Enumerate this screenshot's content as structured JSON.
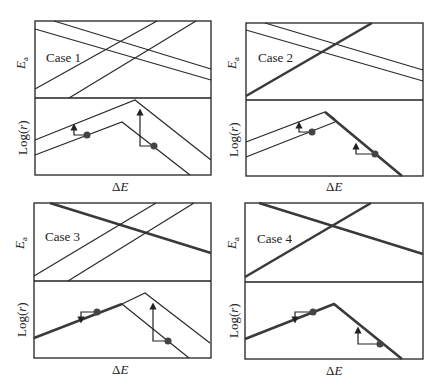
{
  "figure": {
    "axis_labels": {
      "ea": "E",
      "ea_sub": "a",
      "logr": "Log(r)",
      "de": "ΔE"
    },
    "panels": [
      {
        "case_label": "Case 1"
      },
      {
        "case_label": "Case 2"
      },
      {
        "case_label": "Case 3"
      },
      {
        "case_label": "Case 4"
      }
    ]
  },
  "colors": {
    "line": "#2a2a2a",
    "thick": "#3a3a3a",
    "dot": "#444444"
  }
}
